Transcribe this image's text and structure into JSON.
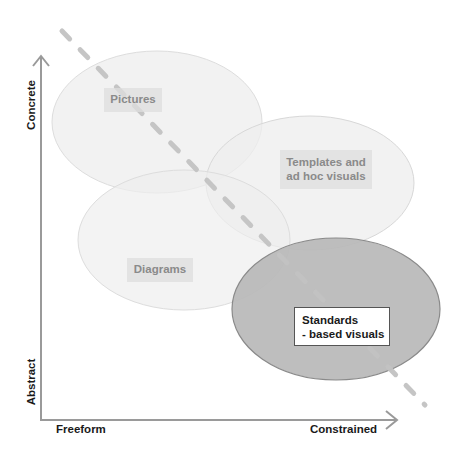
{
  "diagram": {
    "axes": {
      "y_top_label": "Concrete",
      "y_bottom_label": "Abstract",
      "x_left_label": "Freeform",
      "x_right_label": "Constrained"
    },
    "regions": [
      {
        "id": "pictures",
        "lines": [
          "Pictures"
        ],
        "fill": "#f0f0f0",
        "emphasis": false
      },
      {
        "id": "templates",
        "lines": [
          "Templates and",
          "ad hoc visuals"
        ],
        "fill": "#f0f0f0",
        "emphasis": false
      },
      {
        "id": "diagrams",
        "lines": [
          "Diagrams"
        ],
        "fill": "#f0f0f0",
        "emphasis": false
      },
      {
        "id": "standards",
        "lines": [
          "Standards",
          "- based visuals"
        ],
        "fill": "#b8b8b8",
        "emphasis": true
      }
    ],
    "trend_line": {
      "style": "dashed",
      "direction": "top-left to bottom-right",
      "color": "#c4c4c4"
    },
    "colors": {
      "axis": "#9a9a9a",
      "light_ellipse_fill": "#f0f0f0",
      "light_ellipse_stroke": "#dcdcdc",
      "dark_ellipse_fill": "#b8b8b8",
      "dark_ellipse_stroke": "#8c8c8c",
      "light_label_text": "#8a8a8a",
      "dark_label_text": "#1a1a1a"
    }
  }
}
